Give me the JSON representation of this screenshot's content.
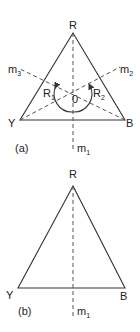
{
  "figure_a": {
    "caption": "(a)",
    "vertices": {
      "top": "R",
      "left": "Y",
      "right": "B"
    },
    "mirror_lines": [
      {
        "label": "m",
        "sub": "1"
      },
      {
        "label": "m",
        "sub": "2"
      },
      {
        "label": "m",
        "sub": "3"
      }
    ],
    "rotations": [
      {
        "label": "R",
        "sub": "1"
      },
      {
        "label": "R",
        "sub": "2"
      }
    ],
    "center_label": "0"
  },
  "figure_b": {
    "caption": "(b)",
    "vertices": {
      "top": "R",
      "left": "Y",
      "right": "B"
    },
    "mirror_lines": [
      {
        "label": "m",
        "sub": "1"
      }
    ]
  }
}
